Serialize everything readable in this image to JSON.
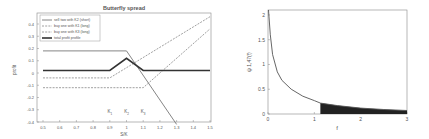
{
  "chart_data": [
    {
      "type": "line",
      "title": "Butterfly spread",
      "xlabel": "S/K",
      "ylabel": "profit",
      "xlim": [
        0.5,
        1.5
      ],
      "ylim": [
        -0.4,
        0.5
      ],
      "xticks": [
        "0.5",
        "0.6",
        "0.7",
        "0.8",
        "0.9",
        "1",
        "1.1",
        "1.2",
        "1.3",
        "1.4",
        "1.5"
      ],
      "yticks": [
        "0.4",
        "0.3",
        "0.2",
        "0.1",
        "0",
        "-0.1",
        "-0.2",
        "-0.3",
        "-0.4"
      ],
      "annotations": [
        "K1",
        "K2",
        "K3"
      ],
      "annotation_x": [
        0.9,
        1.0,
        1.1
      ],
      "legend_position": "upper left",
      "series": [
        {
          "name": "sell two with K2 (short)",
          "style": "solid",
          "x": [
            0.5,
            1.0,
            1.3
          ],
          "y": [
            0.18,
            0.18,
            -0.42
          ]
        },
        {
          "name": "buy one with K1 (long)",
          "style": "dashed",
          "x": [
            0.5,
            0.9,
            1.5
          ],
          "y": [
            -0.04,
            -0.04,
            0.46
          ]
        },
        {
          "name": "buy one with K3 (long)",
          "style": "dashed",
          "x": [
            0.5,
            1.1,
            1.5
          ],
          "y": [
            -0.12,
            -0.12,
            0.36
          ]
        },
        {
          "name": "total profit profile",
          "style": "solid-thick",
          "x": [
            0.5,
            0.9,
            1.0,
            1.1,
            1.5
          ],
          "y": [
            0.02,
            0.02,
            0.12,
            0.02,
            0.02
          ]
        }
      ]
    },
    {
      "type": "area",
      "title": "",
      "xlabel": "f",
      "ylabel": "ψ 1,47(f)",
      "xlim": [
        0,
        3
      ],
      "ylim": [
        0,
        2.1
      ],
      "xticks": [
        "0",
        "1",
        "2",
        "3"
      ],
      "yticks": [
        "0",
        "0.5",
        "1",
        "1.5",
        "2"
      ],
      "shaded_region": {
        "from": 1.13,
        "to": 3
      },
      "series": [
        {
          "name": "density",
          "x": [
            0.01,
            0.05,
            0.1,
            0.2,
            0.3,
            0.5,
            0.75,
            1.0,
            1.13,
            1.5,
            2.0,
            2.5,
            3.0
          ],
          "y": [
            2.1,
            1.6,
            1.2,
            0.85,
            0.68,
            0.5,
            0.36,
            0.27,
            0.22,
            0.17,
            0.12,
            0.09,
            0.07
          ]
        }
      ]
    }
  ]
}
